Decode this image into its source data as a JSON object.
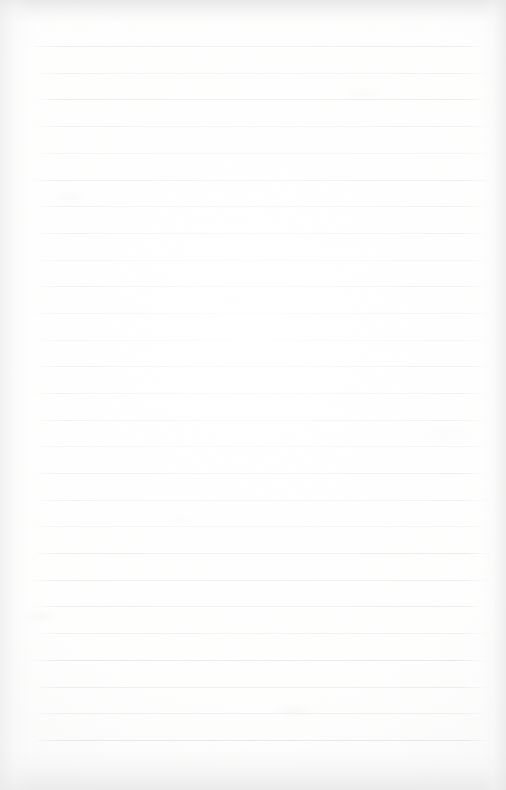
{
  "document": {
    "type": "lined-notebook-page",
    "title": "Blank ruled notepad page",
    "page_width": 506,
    "page_height": 790,
    "background_color": "#fdfdfc",
    "is_blank": true,
    "visible_text": "",
    "ruling": {
      "line_color": "#c9ccd2",
      "line_thickness_px": 1,
      "line_spacing_px": 26.7,
      "first_line_y": 46,
      "last_line_y": 740,
      "line_start_x": 34,
      "line_end_x": 487,
      "line_count": 27,
      "line_y_positions": [
        46,
        73,
        99,
        126,
        153,
        180,
        206,
        233,
        260,
        286,
        313,
        340,
        366,
        393,
        420,
        446,
        473,
        500,
        526,
        553,
        580,
        606,
        633,
        660,
        687,
        713,
        740
      ]
    },
    "margins": {
      "top_px": 46,
      "bottom_px": 50,
      "left_px": 34,
      "right_px": 19
    },
    "scan_artifacts": {
      "top_edge_shadow": true,
      "bottom_edge_shadow": true,
      "left_edge_shadow": true,
      "right_edge_shadow": true,
      "paper_grain": true,
      "smudges": true
    }
  }
}
